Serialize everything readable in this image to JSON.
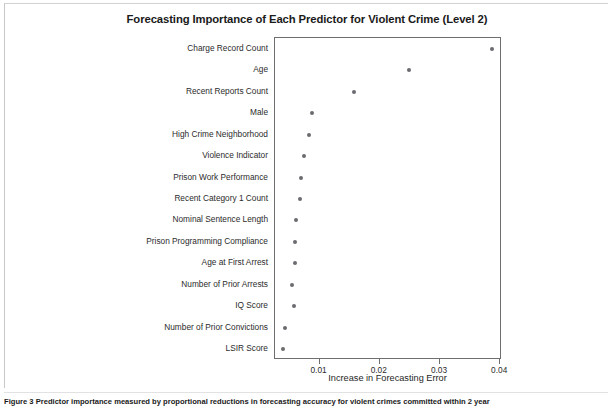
{
  "figure": {
    "caption": "Figure 3 Predictor importance measured by proportional reductions in forecasting accuracy for violent crimes committed within 2 year"
  },
  "chart_data": {
    "type": "scatter",
    "title": "Forecasting Importance of Each Predictor for Violent Crime (Level 2)",
    "xlabel": "Increase in Forecasting Error",
    "ylabel": "",
    "xlim": [
      0.0026,
      0.0403
    ],
    "xticks": [
      0.01,
      0.02,
      0.03,
      0.04
    ],
    "xticklabels": [
      "0.01",
      "0.02",
      "0.03",
      "0.04"
    ],
    "grid": false,
    "legend": "none",
    "marker_color": "#6b6b70",
    "categories": [
      "Charge Record Count",
      "Age",
      "Recent Reports Count",
      "Male",
      "High Crime Neighborhood",
      "Violence Indicator",
      "Prison Work Performance",
      "Recent Category 1 Count",
      "Nominal Sentence Length",
      "Prison Programming Compliance",
      "Age at First Arrest",
      "Number of Prior Arrests",
      "IQ Score",
      "Number of Prior Convictions",
      "LSIR Score"
    ],
    "values": [
      0.0387,
      0.0248,
      0.0157,
      0.0087,
      0.0082,
      0.0074,
      0.007,
      0.0067,
      0.0061,
      0.006,
      0.006,
      0.0055,
      0.0058,
      0.0042,
      0.004
    ]
  }
}
